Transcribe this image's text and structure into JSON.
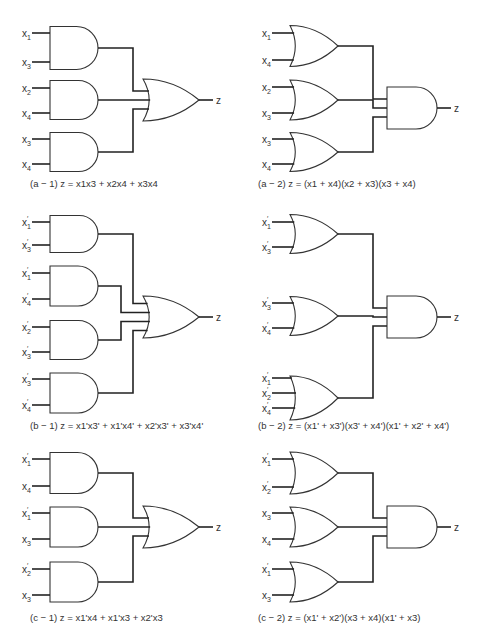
{
  "figure": {
    "panels": [
      {
        "id": "a-1",
        "caption_tag": "(a − 1)",
        "equation": "z = x1x3 + x2x4 + x3x4",
        "first_level": "AND",
        "second_level": "OR",
        "output": "z",
        "gates": [
          {
            "inputs": [
              {
                "name": "x",
                "sub": "1",
                "prime": false
              },
              {
                "name": "x",
                "sub": "3",
                "prime": false
              }
            ]
          },
          {
            "inputs": [
              {
                "name": "x",
                "sub": "2",
                "prime": false
              },
              {
                "name": "x",
                "sub": "4",
                "prime": false
              }
            ]
          },
          {
            "inputs": [
              {
                "name": "x",
                "sub": "3",
                "prime": false
              },
              {
                "name": "x",
                "sub": "4",
                "prime": false
              }
            ]
          }
        ]
      },
      {
        "id": "a-2",
        "caption_tag": "(a − 2)",
        "equation": "z = (x1 + x4)(x2 + x3)(x3 + x4)",
        "first_level": "OR",
        "second_level": "AND",
        "output": "z",
        "gates": [
          {
            "inputs": [
              {
                "name": "x",
                "sub": "1",
                "prime": false
              },
              {
                "name": "x",
                "sub": "4",
                "prime": false
              }
            ]
          },
          {
            "inputs": [
              {
                "name": "x",
                "sub": "2",
                "prime": false
              },
              {
                "name": "x",
                "sub": "3",
                "prime": false
              }
            ]
          },
          {
            "inputs": [
              {
                "name": "x",
                "sub": "3",
                "prime": false
              },
              {
                "name": "x",
                "sub": "4",
                "prime": false
              }
            ]
          }
        ]
      },
      {
        "id": "b-1",
        "caption_tag": "(b − 1)",
        "equation": "z = x1'x3' + x1'x4' + x2'x3' + x3'x4'",
        "first_level": "AND",
        "second_level": "OR",
        "output": "z",
        "gates": [
          {
            "inputs": [
              {
                "name": "x",
                "sub": "1",
                "prime": true
              },
              {
                "name": "x",
                "sub": "3",
                "prime": true
              }
            ]
          },
          {
            "inputs": [
              {
                "name": "x",
                "sub": "1",
                "prime": true
              },
              {
                "name": "x",
                "sub": "4",
                "prime": true
              }
            ]
          },
          {
            "inputs": [
              {
                "name": "x",
                "sub": "2",
                "prime": true
              },
              {
                "name": "x",
                "sub": "3",
                "prime": true
              }
            ]
          },
          {
            "inputs": [
              {
                "name": "x",
                "sub": "3",
                "prime": true
              },
              {
                "name": "x",
                "sub": "4",
                "prime": true
              }
            ]
          }
        ]
      },
      {
        "id": "b-2",
        "caption_tag": "(b − 2)",
        "equation": "z = (x1' + x3')(x3' + x4')(x1' + x2' + x4')",
        "first_level": "OR",
        "second_level": "AND",
        "output": "z",
        "gates": [
          {
            "inputs": [
              {
                "name": "x",
                "sub": "1",
                "prime": true
              },
              {
                "name": "x",
                "sub": "3",
                "prime": true
              }
            ]
          },
          {
            "inputs": [
              {
                "name": "x",
                "sub": "3",
                "prime": true
              },
              {
                "name": "x",
                "sub": "4",
                "prime": true
              }
            ]
          },
          {
            "inputs": [
              {
                "name": "x",
                "sub": "1",
                "prime": true
              },
              {
                "name": "x",
                "sub": "2",
                "prime": true
              },
              {
                "name": "x",
                "sub": "4",
                "prime": true
              }
            ]
          }
        ]
      },
      {
        "id": "c-1",
        "caption_tag": "(c − 1)",
        "equation": "z = x1'x4 + x1'x3 + x2'x3",
        "first_level": "AND",
        "second_level": "OR",
        "output": "z",
        "gates": [
          {
            "inputs": [
              {
                "name": "x",
                "sub": "1",
                "prime": true
              },
              {
                "name": "x",
                "sub": "4",
                "prime": false
              }
            ]
          },
          {
            "inputs": [
              {
                "name": "x",
                "sub": "1",
                "prime": true
              },
              {
                "name": "x",
                "sub": "3",
                "prime": false
              }
            ]
          },
          {
            "inputs": [
              {
                "name": "x",
                "sub": "2",
                "prime": true
              },
              {
                "name": "x",
                "sub": "3",
                "prime": false
              }
            ]
          }
        ]
      },
      {
        "id": "c-2",
        "caption_tag": "(c − 2)",
        "equation": "z = (x1' + x2')(x3 + x4)(x1' + x3)",
        "first_level": "OR",
        "second_level": "AND",
        "output": "z",
        "gates": [
          {
            "inputs": [
              {
                "name": "x",
                "sub": "1",
                "prime": true
              },
              {
                "name": "x",
                "sub": "2",
                "prime": true
              }
            ]
          },
          {
            "inputs": [
              {
                "name": "x",
                "sub": "3",
                "prime": false
              },
              {
                "name": "x",
                "sub": "4",
                "prime": false
              }
            ]
          },
          {
            "inputs": [
              {
                "name": "x",
                "sub": "1",
                "prime": true
              },
              {
                "name": "x",
                "sub": "3",
                "prime": false
              }
            ]
          }
        ]
      }
    ]
  }
}
